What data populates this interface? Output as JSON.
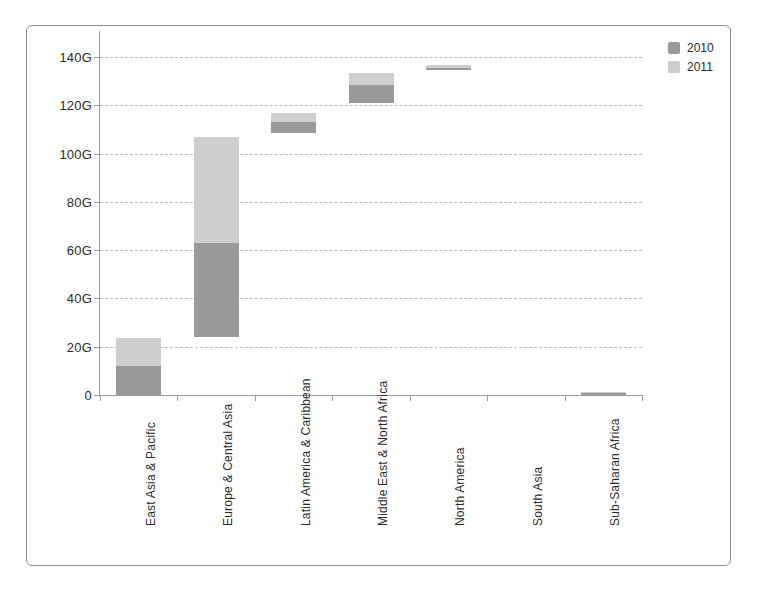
{
  "chart_data": {
    "type": "bar",
    "title": "",
    "subtitle": "",
    "xlabel": "",
    "ylabel": "",
    "grid": true,
    "legend_position": "top-right",
    "stacked_floating": true,
    "ylim": [
      0,
      146
    ],
    "yticks": [
      0,
      20,
      40,
      60,
      80,
      100,
      120,
      140
    ],
    "ytick_labels": [
      "0",
      "20G",
      "40G",
      "60G",
      "80G",
      "100G",
      "120G",
      "140G"
    ],
    "categories": [
      "East Asia & Pacific",
      "Europe & Central Asia",
      "Latin America & Caribbean",
      "Middle East & North Africa",
      "North America",
      "South Asia",
      "Sub-Saharan Africa"
    ],
    "series": [
      {
        "name": "2010",
        "color": "#9a9a9a",
        "segments": [
          {
            "category": "East Asia & Pacific",
            "start": 0,
            "end": 12.2
          },
          {
            "category": "Europe & Central Asia",
            "start": 24.0,
            "end": 63.0
          },
          {
            "category": "Latin America & Caribbean",
            "start": 108.5,
            "end": 113.0
          },
          {
            "category": "Middle East & North Africa",
            "start": 121.0,
            "end": 128.5
          },
          {
            "category": "North America",
            "start": 134.8,
            "end": 135.6
          },
          {
            "category": "South Asia",
            "start": 0,
            "end": 0
          },
          {
            "category": "Sub-Saharan Africa",
            "start": 0,
            "end": 0.7
          }
        ],
        "values": [
          12.2,
          39.0,
          4.5,
          7.5,
          0.8,
          0.0,
          0.7
        ]
      },
      {
        "name": "2011",
        "color": "#cecece",
        "segments": [
          {
            "category": "East Asia & Pacific",
            "start": 12.2,
            "end": 23.8
          },
          {
            "category": "Europe & Central Asia",
            "start": 63.0,
            "end": 107.0
          },
          {
            "category": "Latin America & Caribbean",
            "start": 113.0,
            "end": 117.0
          },
          {
            "category": "Middle East & North Africa",
            "start": 128.5,
            "end": 133.5
          },
          {
            "category": "North America",
            "start": 135.6,
            "end": 136.8
          },
          {
            "category": "South Asia",
            "start": 0,
            "end": 0
          },
          {
            "category": "Sub-Saharan Africa",
            "start": 0.7,
            "end": 1.4
          }
        ],
        "values": [
          11.6,
          44.0,
          4.0,
          5.0,
          1.2,
          0.0,
          0.7
        ]
      }
    ]
  },
  "legend": {
    "items": [
      {
        "label": "2010",
        "color": "#9a9a9a"
      },
      {
        "label": "2011",
        "color": "#cecece"
      }
    ]
  },
  "axis": {
    "y_tick_labels": [
      "140G",
      "120G",
      "100G",
      "80G",
      "60G",
      "40G",
      "20G",
      "0"
    ],
    "x_tick_labels": [
      "East Asia & Pacific",
      "Europe & Central Asia",
      "Latin America & Caribbean",
      "Middle East & North Africa",
      "North America",
      "South Asia",
      "Sub-Saharan Africa"
    ]
  }
}
